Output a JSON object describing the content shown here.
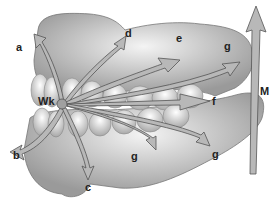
{
  "diagram": {
    "origin_label": "Wk",
    "labels": {
      "a": "a",
      "b": "b",
      "c": "c",
      "d": "d",
      "e": "e",
      "f": "f",
      "g_upper": "g",
      "g_lower_mid": "g",
      "g_lower_right": "g",
      "M": "M"
    },
    "colors": {
      "arrow_fill": "#b8b8b8",
      "arrow_stroke": "#555555",
      "jaw_fill": "#d9d9d9",
      "tooth_fill": "#e8e8e8",
      "origin_dot": "#a0a0a0"
    }
  }
}
